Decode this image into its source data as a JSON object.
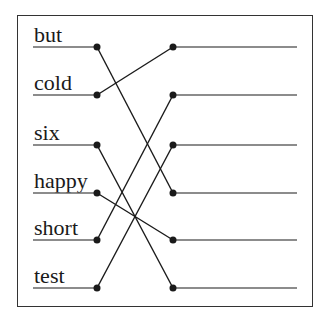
{
  "left_items": [
    {
      "label": "but",
      "y": 47
    },
    {
      "label": "cold",
      "y": 95
    },
    {
      "label": "six",
      "y": 145
    },
    {
      "label": "happy",
      "y": 193
    },
    {
      "label": "short",
      "y": 240
    },
    {
      "label": "test",
      "y": 288
    }
  ],
  "right_items": [
    {
      "label": "",
      "y": 47
    },
    {
      "label": "",
      "y": 95
    },
    {
      "label": "",
      "y": 145
    },
    {
      "label": "",
      "y": 193
    },
    {
      "label": "",
      "y": 240
    },
    {
      "label": "",
      "y": 288
    }
  ],
  "connections": [
    {
      "from": "but",
      "left_index": 0,
      "right_index": 3
    },
    {
      "from": "cold",
      "left_index": 1,
      "right_index": 0
    },
    {
      "from": "six",
      "left_index": 2,
      "right_index": 5
    },
    {
      "from": "happy",
      "left_index": 3,
      "right_index": 4
    },
    {
      "from": "short",
      "left_index": 4,
      "right_index": 1
    },
    {
      "from": "test",
      "left_index": 5,
      "right_index": 2
    }
  ],
  "colors": {
    "line": "#1a1a1a",
    "underline": "#666666",
    "frame": "#333333"
  }
}
